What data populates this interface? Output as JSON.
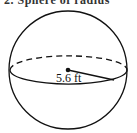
{
  "problem": {
    "header_text": "2. Sphere of radius",
    "figure": {
      "shape": "sphere",
      "radius_label": "5.6 ft",
      "radius_value": 5.6,
      "radius_unit": "ft"
    }
  }
}
